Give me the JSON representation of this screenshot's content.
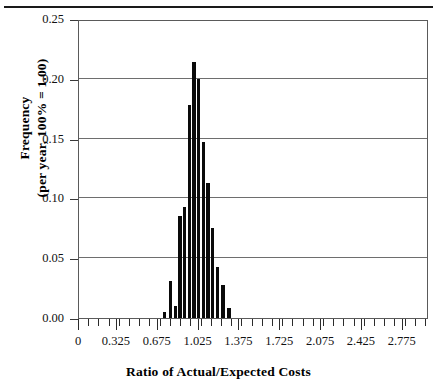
{
  "chart_data": {
    "type": "bar",
    "title": "",
    "subtitle": "",
    "xlabel": "Ratio of Actual/Expected Costs",
    "ylabel_line1": "Frequency",
    "ylabel_line2": "(per year, 100% = 1.00)",
    "xlim": [
      0.0,
      3.0
    ],
    "ylim": [
      0.0,
      0.25
    ],
    "grid": "horizontal",
    "legend": "none",
    "x_tick_labels": [
      "0",
      "0.325",
      "0.675",
      "1.025",
      "1.375",
      "1.725",
      "2.075",
      "2.425",
      "2.775"
    ],
    "x_tick_values": [
      0.0,
      0.325,
      0.675,
      1.025,
      1.375,
      1.725,
      2.075,
      2.425,
      2.775
    ],
    "x_minor_tick_step": 0.0875,
    "y_tick_labels": [
      "0.00",
      "0.05",
      "0.10",
      "0.15",
      "0.20",
      "0.25"
    ],
    "y_tick_values": [
      0.0,
      0.05,
      0.1,
      0.15,
      0.2,
      0.25
    ],
    "bar_width": 0.028,
    "x": [
      0.735,
      0.785,
      0.825,
      0.865,
      0.905,
      0.945,
      0.985,
      1.025,
      1.065,
      1.105,
      1.145,
      1.185,
      1.235,
      1.285
    ],
    "values": [
      0.005,
      0.031,
      0.01,
      0.085,
      0.093,
      0.178,
      0.214,
      0.2,
      0.147,
      0.113,
      0.075,
      0.043,
      0.028,
      0.008
    ],
    "categories": [
      "0.735",
      "0.785",
      "0.825",
      "0.865",
      "0.905",
      "0.945",
      "0.985",
      "1.025",
      "1.065",
      "1.105",
      "1.145",
      "1.185",
      "1.235",
      "1.285"
    ],
    "series": [
      {
        "name": "Frequency",
        "values": [
          0.005,
          0.031,
          0.01,
          0.085,
          0.093,
          0.178,
          0.214,
          0.2,
          0.147,
          0.113,
          0.075,
          0.043,
          0.028,
          0.008
        ]
      }
    ],
    "bar_color": "#0a0a0a",
    "gridline_color": "#6e6e6e",
    "frame_color": "#5a5a5a"
  }
}
